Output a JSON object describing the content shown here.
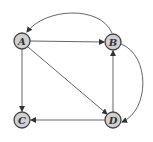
{
  "diagram": {
    "type": "directed-graph",
    "nodes": [
      {
        "id": "A",
        "label": "A",
        "x": 22,
        "y": 41
      },
      {
        "id": "B",
        "label": "B",
        "x": 113,
        "y": 42
      },
      {
        "id": "C",
        "label": "C",
        "x": 22,
        "y": 120
      },
      {
        "id": "D",
        "label": "D",
        "x": 113,
        "y": 120
      }
    ],
    "edges": [
      {
        "from": "A",
        "to": "B",
        "style": "straight"
      },
      {
        "from": "B",
        "to": "A",
        "style": "curved-top"
      },
      {
        "from": "A",
        "to": "C",
        "style": "straight"
      },
      {
        "from": "A",
        "to": "D",
        "style": "straight"
      },
      {
        "from": "B",
        "to": "D",
        "style": "curved-right"
      },
      {
        "from": "D",
        "to": "B",
        "style": "straight"
      },
      {
        "from": "D",
        "to": "C",
        "style": "straight"
      }
    ],
    "colors": {
      "node_fill": "#d0d0d0",
      "stroke": "#444444"
    }
  }
}
